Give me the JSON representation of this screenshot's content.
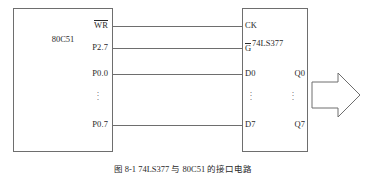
{
  "figure": {
    "caption": "图 8-1  74LS377 与 80C51 的接口电路",
    "arrow_icon": "right-block-arrow-icon"
  },
  "mcu": {
    "name": "80C51",
    "pins": [
      {
        "label": "WR",
        "overline": true
      },
      {
        "label": "P2.7",
        "overline": false
      },
      {
        "label": "P0.0",
        "overline": false
      },
      {
        "label": "P0.7",
        "overline": false
      }
    ],
    "ellipsis": "⋮"
  },
  "latch": {
    "name": "74LS377",
    "inputs": [
      {
        "label": "CK",
        "overline": false
      },
      {
        "label": "G",
        "overline": true
      },
      {
        "label": "D0",
        "overline": false
      },
      {
        "label": "D7",
        "overline": false
      }
    ],
    "outputs": [
      {
        "label": "Q0"
      },
      {
        "label": "Q7"
      }
    ],
    "ellipsis": "⋮"
  },
  "colors": {
    "line": "#6e6e6e",
    "text": "#2a2a2a",
    "background": "#ffffff"
  }
}
